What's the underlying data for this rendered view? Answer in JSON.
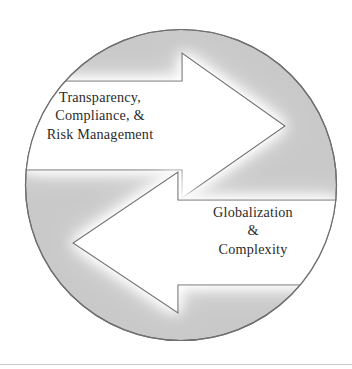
{
  "figure": {
    "name": "cyclical-two-arrow-diagram",
    "shape": "circle",
    "colors": {
      "circle_fill": "#c9c9c9",
      "circle_stroke": "#6f6f6f",
      "arrow_fill": "#ffffff",
      "arrow_stroke": "#6a6a6a",
      "text": "#2b2b2b",
      "background": "#ffffff",
      "rule": "#c9c9c9"
    },
    "geometry": {
      "circle_center_x": 181,
      "circle_center_y": 185,
      "circle_radius": 156
    }
  },
  "labels": {
    "top_left": {
      "name": "transparency-compliance-risk-management",
      "lines": [
        "Transparency,",
        "Compliance, &",
        "Risk Management"
      ]
    },
    "bottom_right": {
      "name": "globalization-complexity",
      "lines": [
        "Globalization",
        "&",
        "Complexity"
      ]
    }
  },
  "arrows": {
    "upper": {
      "name": "arrow-right-upper",
      "direction": "right",
      "points": "25,81 182,81 182,53 285,126 182,198 182,170 25,170"
    },
    "lower": {
      "name": "arrow-left-lower",
      "direction": "left",
      "points": "337,200 178,200 178,172 73,243 178,313 178,285 337,285"
    }
  }
}
